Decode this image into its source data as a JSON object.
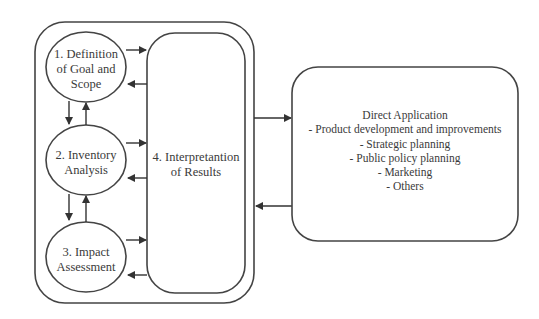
{
  "diagram": {
    "stages": [
      {
        "id": "goal-scope",
        "label": "1. Definition of Goal and Scope",
        "lines": [
          "1. Definition",
          "of Goal and",
          "Scope"
        ]
      },
      {
        "id": "inventory",
        "label": "2. Inventory Analysis",
        "lines": [
          "2. Inventory",
          "Analysis"
        ]
      },
      {
        "id": "impact",
        "label": "3. Impact Assessment",
        "lines": [
          "3. Impact",
          "Assessment"
        ]
      }
    ],
    "interpretation": {
      "label": "4. Interpretantion of Results",
      "lines": [
        "4. Interpretantion",
        "of Results"
      ]
    },
    "application": {
      "title": "Direct Application",
      "items": [
        "- Product development and improvements",
        "- Strategic planning",
        "- Public policy planning",
        "- Marketing",
        "- Others"
      ]
    },
    "colors": {
      "stroke": "#3a3a3a",
      "text": "#3a3a3a",
      "background": "#ffffff"
    }
  }
}
